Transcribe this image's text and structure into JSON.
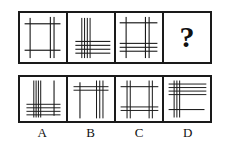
{
  "puzzle": {
    "type": "visual-analogy-matrix",
    "stroke_color": "#1a1a1a",
    "background_color": "#ffffff",
    "question_mark": "?",
    "sequence": [
      {
        "id": "q1",
        "name": "sequence-figure-1",
        "description": "Open square frame: one left vertical, a pair of right verticals, two horizontals",
        "verticals": [
          {
            "x": 22,
            "width": 2.4,
            "y1": 10,
            "y2": 92
          },
          {
            "x": 66,
            "width": 2.4,
            "y1": 8,
            "y2": 92
          },
          {
            "x": 74,
            "width": 2.4,
            "y1": 8,
            "y2": 92
          }
        ],
        "horizontals": [
          {
            "y": 22,
            "height": 2.4,
            "x1": 10,
            "x2": 88
          },
          {
            "y": 76,
            "height": 2.4,
            "x1": 10,
            "x2": 88
          }
        ]
      },
      {
        "id": "q2",
        "name": "sequence-figure-2",
        "description": "Bundle of four verticals left-of-center crossing four horizontals in lower half",
        "verticals": [
          {
            "x": 30,
            "width": 2.2,
            "y1": 10,
            "y2": 92
          },
          {
            "x": 36,
            "width": 2.2,
            "y1": 10,
            "y2": 92
          },
          {
            "x": 42,
            "width": 2.2,
            "y1": 10,
            "y2": 92
          },
          {
            "x": 48,
            "width": 2.2,
            "y1": 10,
            "y2": 92
          }
        ],
        "horizontals": [
          {
            "y": 58,
            "height": 2.2,
            "x1": 16,
            "x2": 92
          },
          {
            "y": 66,
            "height": 2.2,
            "x1": 16,
            "x2": 92
          },
          {
            "y": 74,
            "height": 2.2,
            "x1": 16,
            "x2": 92
          },
          {
            "y": 82,
            "height": 2.2,
            "x1": 16,
            "x2": 92
          }
        ]
      },
      {
        "id": "q3",
        "name": "sequence-figure-3",
        "description": "Square frame with left vertical, right vertical pair, top horizontal and three lower horizontals",
        "verticals": [
          {
            "x": 22,
            "width": 2.4,
            "y1": 8,
            "y2": 92
          },
          {
            "x": 64,
            "width": 2.4,
            "y1": 8,
            "y2": 92
          },
          {
            "x": 72,
            "width": 2.4,
            "y1": 8,
            "y2": 92
          }
        ],
        "horizontals": [
          {
            "y": 20,
            "height": 2.4,
            "x1": 8,
            "x2": 90
          },
          {
            "y": 62,
            "height": 2.2,
            "x1": 8,
            "x2": 90
          },
          {
            "y": 70,
            "height": 2.2,
            "x1": 8,
            "x2": 90
          },
          {
            "y": 78,
            "height": 2.2,
            "x1": 8,
            "x2": 90
          }
        ]
      },
      {
        "id": "q4",
        "name": "sequence-figure-missing",
        "description": "Unknown figure marked with a question mark",
        "is_question": true
      }
    ],
    "options": [
      {
        "id": "A",
        "label": "A",
        "name": "option-a",
        "description": "Vertical bundle left-of-center, single right vertical, horizontal bundle across bottom",
        "verticals": [
          {
            "x": 30,
            "width": 2.2,
            "y1": 8,
            "y2": 92
          },
          {
            "x": 35,
            "width": 2.2,
            "y1": 8,
            "y2": 92
          },
          {
            "x": 40,
            "width": 2.2,
            "y1": 8,
            "y2": 92
          },
          {
            "x": 45,
            "width": 2.2,
            "y1": 8,
            "y2": 92
          },
          {
            "x": 74,
            "width": 2.4,
            "y1": 8,
            "y2": 88
          }
        ],
        "horizontals": [
          {
            "y": 62,
            "height": 2.2,
            "x1": 14,
            "x2": 88
          },
          {
            "y": 70,
            "height": 2.2,
            "x1": 14,
            "x2": 88
          },
          {
            "y": 78,
            "height": 2.2,
            "x1": 14,
            "x2": 88
          },
          {
            "y": 86,
            "height": 2.2,
            "x1": 14,
            "x2": 88
          }
        ]
      },
      {
        "id": "B",
        "label": "B",
        "name": "option-b",
        "description": "Single left vertical and a right bundle of three verticals crossed by two horizontals near the top",
        "verticals": [
          {
            "x": 26,
            "width": 2.4,
            "y1": 12,
            "y2": 94
          },
          {
            "x": 62,
            "width": 2.2,
            "y1": 8,
            "y2": 94
          },
          {
            "x": 69,
            "width": 2.2,
            "y1": 8,
            "y2": 94
          },
          {
            "x": 76,
            "width": 2.2,
            "y1": 8,
            "y2": 94
          }
        ],
        "horizontals": [
          {
            "y": 22,
            "height": 2.2,
            "x1": 12,
            "x2": 88
          },
          {
            "y": 30,
            "height": 2.2,
            "x1": 12,
            "x2": 88
          }
        ]
      },
      {
        "id": "C",
        "label": "C",
        "name": "option-c",
        "description": "Square frame: left vertical pair and right vertical pair with a top horizontal and a lower horizontal pair",
        "verticals": [
          {
            "x": 24,
            "width": 2.2,
            "y1": 8,
            "y2": 94
          },
          {
            "x": 31,
            "width": 2.2,
            "y1": 8,
            "y2": 94
          },
          {
            "x": 72,
            "width": 2.2,
            "y1": 8,
            "y2": 94
          },
          {
            "x": 79,
            "width": 2.2,
            "y1": 8,
            "y2": 94
          }
        ],
        "horizontals": [
          {
            "y": 22,
            "height": 2.4,
            "x1": 10,
            "x2": 92
          },
          {
            "y": 68,
            "height": 2.2,
            "x1": 10,
            "x2": 92
          },
          {
            "y": 76,
            "height": 2.2,
            "x1": 10,
            "x2": 92
          }
        ]
      },
      {
        "id": "D",
        "label": "D",
        "name": "option-d",
        "description": "Vertical bundle on the left crossing four horizontals at the top plus one single horizontal lower down",
        "verticals": [
          {
            "x": 22,
            "width": 2.2,
            "y1": 8,
            "y2": 92
          },
          {
            "x": 28,
            "width": 2.2,
            "y1": 8,
            "y2": 92
          },
          {
            "x": 34,
            "width": 2.2,
            "y1": 8,
            "y2": 92
          }
        ],
        "horizontals": [
          {
            "y": 16,
            "height": 2.2,
            "x1": 10,
            "x2": 92
          },
          {
            "y": 24,
            "height": 2.2,
            "x1": 10,
            "x2": 92
          },
          {
            "y": 32,
            "height": 2.2,
            "x1": 10,
            "x2": 92
          },
          {
            "y": 40,
            "height": 2.2,
            "x1": 10,
            "x2": 92
          },
          {
            "y": 74,
            "height": 2.4,
            "x1": 10,
            "x2": 88
          }
        ]
      }
    ]
  }
}
